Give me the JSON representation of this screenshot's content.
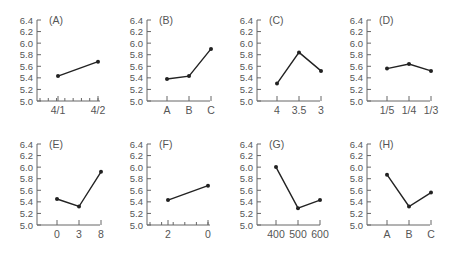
{
  "figure": {
    "y_ticks": [
      "5.0",
      "5.2",
      "5.4",
      "5.6",
      "5.8",
      "6.0",
      "6.2",
      "6.4"
    ],
    "line_color": "#222222",
    "axis_color": "#666666",
    "text_color": "#555555"
  },
  "chart_data": [
    {
      "type": "line",
      "title": "(A)",
      "categories": [
        "4/1",
        "4/2"
      ],
      "values": [
        5.43,
        5.68
      ],
      "ylim": [
        5.0,
        6.4
      ],
      "minor_ticks": 7
    },
    {
      "type": "line",
      "title": "(B)",
      "categories": [
        "A",
        "B",
        "C"
      ],
      "values": [
        5.38,
        5.43,
        5.9
      ],
      "ylim": [
        5.0,
        6.4
      ]
    },
    {
      "type": "line",
      "title": "(C)",
      "categories": [
        "4",
        "3.5",
        "3"
      ],
      "values": [
        5.3,
        5.84,
        5.52
      ],
      "ylim": [
        5.0,
        6.4
      ]
    },
    {
      "type": "line",
      "title": "(D)",
      "categories": [
        "1/5",
        "1/4",
        "1/3"
      ],
      "values": [
        5.56,
        5.64,
        5.52
      ],
      "ylim": [
        5.0,
        6.4
      ]
    },
    {
      "type": "line",
      "title": "(E)",
      "categories": [
        "0",
        "3",
        "8"
      ],
      "values": [
        5.45,
        5.32,
        5.92
      ],
      "ylim": [
        5.0,
        6.4
      ]
    },
    {
      "type": "line",
      "title": "(F)",
      "categories": [
        "2",
        "0"
      ],
      "values": [
        5.43,
        5.68
      ],
      "ylim": [
        5.0,
        6.4
      ],
      "minor_ticks": 5
    },
    {
      "type": "line",
      "title": "(G)",
      "categories": [
        "400",
        "500",
        "600"
      ],
      "values": [
        6.0,
        5.29,
        5.43
      ],
      "ylim": [
        5.0,
        6.4
      ]
    },
    {
      "type": "line",
      "title": "(H)",
      "categories": [
        "A",
        "B",
        "C"
      ],
      "values": [
        5.87,
        5.32,
        5.56
      ],
      "ylim": [
        5.0,
        6.4
      ]
    }
  ]
}
